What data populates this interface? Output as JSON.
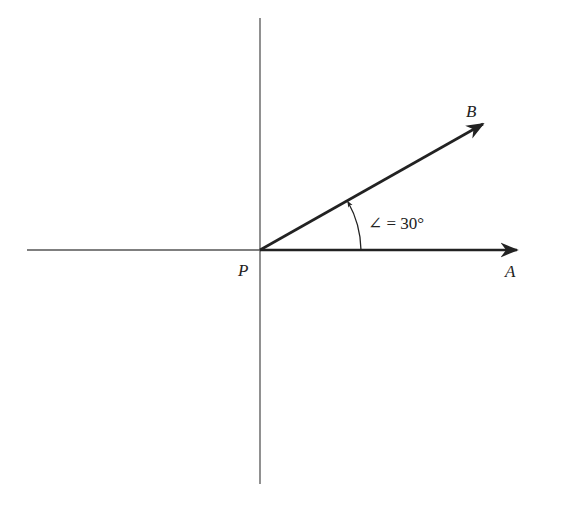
{
  "diagram": {
    "type": "vector angle diagram",
    "points": {
      "origin": "P",
      "vector_a_head": "A",
      "vector_b_head": "B"
    },
    "angle_label": "∠ = 30°",
    "angle_degrees": 30,
    "colors": {
      "axis": "#555555",
      "vector": "#222222",
      "text": "#222222",
      "background": "#ffffff"
    }
  }
}
